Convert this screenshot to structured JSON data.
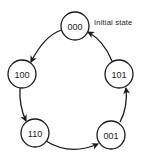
{
  "diagram": {
    "type": "state-transition-cycle",
    "annotation": "Initial state",
    "colors": {
      "stroke": "#1a1a1a",
      "background": "#ffffff"
    },
    "nodes": [
      {
        "id": "000",
        "label": "000"
      },
      {
        "id": "100",
        "label": "100"
      },
      {
        "id": "110",
        "label": "110"
      },
      {
        "id": "001",
        "label": "001"
      },
      {
        "id": "101",
        "label": "101"
      }
    ],
    "edges": [
      {
        "from": "000",
        "to": "100"
      },
      {
        "from": "100",
        "to": "110"
      },
      {
        "from": "110",
        "to": "001"
      },
      {
        "from": "001",
        "to": "101"
      },
      {
        "from": "101",
        "to": "000"
      }
    ]
  }
}
